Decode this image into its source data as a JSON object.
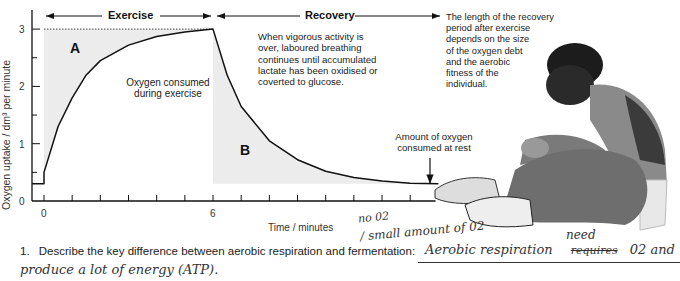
{
  "chart_data": {
    "type": "line",
    "title": "",
    "xlabel": "Time / minutes",
    "ylabel": "Oxygen uptake / dm³ per minute",
    "xlim": [
      -1,
      16
    ],
    "ylim": [
      0,
      3.2
    ],
    "x_ticks_labeled": [
      {
        "value": 0,
        "label": "0"
      },
      {
        "value": 6,
        "label": "6"
      }
    ],
    "x_minor_ticks": [
      0,
      1,
      2,
      3,
      4,
      5,
      6,
      7,
      8,
      9,
      10,
      11,
      12,
      13
    ],
    "y_ticks": [
      {
        "value": 0,
        "label": "0"
      },
      {
        "value": 1,
        "label": "1"
      },
      {
        "value": 2,
        "label": "2"
      },
      {
        "value": 3,
        "label": "3"
      }
    ],
    "y_minor_ticks": [
      0.5,
      1.5,
      2.5
    ],
    "rest_level": 0.3,
    "max_level": 3.0,
    "series": [
      {
        "name": "Oxygen uptake",
        "points": [
          [
            -1,
            0.3
          ],
          [
            0,
            0.3
          ],
          [
            0,
            0.5
          ],
          [
            0.5,
            1.3
          ],
          [
            1,
            1.8
          ],
          [
            1.5,
            2.2
          ],
          [
            2,
            2.45
          ],
          [
            3,
            2.72
          ],
          [
            4,
            2.87
          ],
          [
            5,
            2.95
          ],
          [
            6,
            3.0
          ],
          [
            6.5,
            2.2
          ],
          [
            7,
            1.65
          ],
          [
            8,
            1.05
          ],
          [
            9,
            0.72
          ],
          [
            10,
            0.52
          ],
          [
            11,
            0.41
          ],
          [
            12,
            0.35
          ],
          [
            13,
            0.31
          ],
          [
            14,
            0.3
          ]
        ]
      }
    ],
    "regions": [
      {
        "label": "A",
        "description": "Oxygen consumed during exercise",
        "x_range": [
          0,
          6
        ]
      },
      {
        "label": "B",
        "description": "Oxygen debt (recovery)",
        "x_range": [
          6,
          14
        ]
      }
    ],
    "phases": [
      {
        "label": "Exercise",
        "x_range": [
          0,
          6
        ]
      },
      {
        "label": "Recovery",
        "x_range": [
          6,
          14
        ]
      }
    ],
    "annotations": [
      "Oxygen consumed during exercise",
      "When vigorous activity is over, laboured breathing continues until accumulated lactate has been oxidised or coverted to glucose.",
      "The length of the recovery period after exercise depends on the size of the oxygen debt and the aerobic fitness of the individual.",
      "Amount of oxygen consumed at rest"
    ]
  },
  "labels": {
    "exercise": "Exercise",
    "recovery": "Recovery",
    "region_a": "A",
    "region_b": "B",
    "oxygen_consumed": [
      "Oxygen consumed",
      "during exercise"
    ],
    "recovery_note": [
      "When vigorous activity is",
      "over, laboured breathing",
      "continues until accumulated",
      "lactate has been oxidised or",
      "coverted to glucose."
    ],
    "length_note": [
      "The length of the recovery",
      "period after exercise",
      "depends on the size",
      "of the oxygen debt",
      "and the aerobic",
      "fitness of the",
      "individual."
    ],
    "rest_note": [
      "Amount of oxygen",
      "consumed at rest"
    ]
  },
  "question": {
    "number": "1.",
    "text": "Describe the key difference between aerobic respiration and fermentation:"
  },
  "handwriting": {
    "line1": "no 02",
    "line2": "/ small amount of 02",
    "answer_main": "Aerobic respiration",
    "struck_word": "requires",
    "inserted_word": "need",
    "answer_tail": "02 and",
    "answer_line2": "produce a lot of energy (ATP)."
  }
}
